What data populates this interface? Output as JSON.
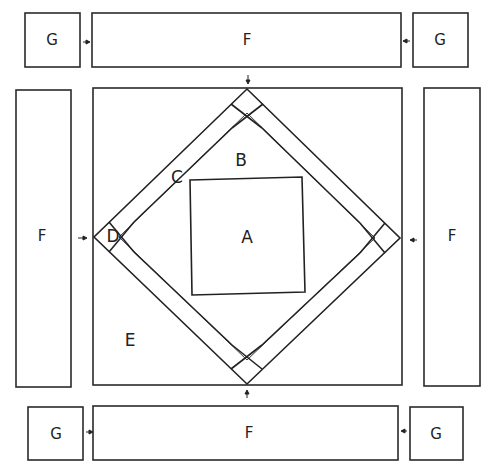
{
  "diagram": {
    "type": "quilt-block-assembly",
    "colors": {
      "line": "#2a2a2a",
      "background": "#ffffff"
    },
    "top_row": {
      "left_corner": {
        "label": "G"
      },
      "border": {
        "label": "F"
      },
      "right_corner": {
        "label": "G"
      }
    },
    "middle_row": {
      "left_border": {
        "label": "F"
      },
      "center_block": {
        "center_square": {
          "label": "A"
        },
        "triangle": {
          "label": "B"
        },
        "strip": {
          "label": "C"
        },
        "corner_square": {
          "label": "D"
        },
        "outer_triangle": {
          "label": "E"
        }
      },
      "right_border": {
        "label": "F"
      }
    },
    "bottom_row": {
      "left_corner": {
        "label": "G"
      },
      "border": {
        "label": "F"
      },
      "right_corner": {
        "label": "G"
      }
    },
    "arrows": [
      {
        "from": "top-left-G",
        "direction": "right"
      },
      {
        "from": "top-right-G",
        "direction": "left"
      },
      {
        "from": "top-F",
        "direction": "down"
      },
      {
        "from": "left-F",
        "direction": "right"
      },
      {
        "from": "right-F",
        "direction": "left"
      },
      {
        "from": "bottom-F",
        "direction": "up"
      },
      {
        "from": "bottom-left-G",
        "direction": "right"
      },
      {
        "from": "bottom-right-G",
        "direction": "left"
      }
    ]
  }
}
